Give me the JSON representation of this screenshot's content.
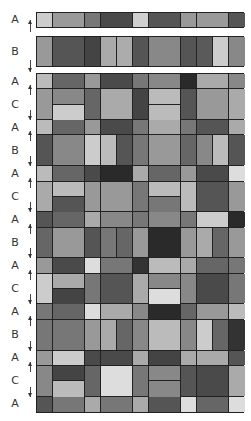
{
  "diagram": {
    "column_edges_px": [
      0,
      16,
      48,
      64,
      96,
      112,
      144,
      160,
      192,
      208
    ],
    "standalone_bands": [
      {
        "label": "A",
        "top": 12,
        "height": 16,
        "cells": [
          {
            "x": 0,
            "w": 16,
            "c": "#cccccc"
          },
          {
            "x": 16,
            "w": 32,
            "c": "#9a9a9a"
          },
          {
            "x": 48,
            "w": 16,
            "c": "#777777"
          },
          {
            "x": 64,
            "w": 32,
            "c": "#4a4a4a"
          },
          {
            "x": 96,
            "w": 16,
            "c": "#cfcfcf"
          },
          {
            "x": 112,
            "w": 32,
            "c": "#555555"
          },
          {
            "x": 144,
            "w": 16,
            "c": "#999999"
          },
          {
            "x": 160,
            "w": 32,
            "c": "#9a9a9a"
          },
          {
            "x": 192,
            "w": 16,
            "c": "#555555"
          }
        ]
      },
      {
        "label": "B",
        "top": 36,
        "height": 31,
        "cells": [
          {
            "x": 0,
            "w": 16,
            "c": "#999999"
          },
          {
            "x": 16,
            "w": 32,
            "c": "#555555"
          },
          {
            "x": 48,
            "w": 16,
            "c": "#444444"
          },
          {
            "x": 64,
            "w": 16,
            "c": "#aaaaaa"
          },
          {
            "x": 80,
            "w": 16,
            "c": "#acacac"
          },
          {
            "x": 96,
            "w": 16,
            "c": "#555555"
          },
          {
            "x": 112,
            "w": 32,
            "c": "#888888"
          },
          {
            "x": 144,
            "w": 16,
            "c": "#555555"
          },
          {
            "x": 160,
            "w": 16,
            "c": "#5a5a5a"
          },
          {
            "x": 176,
            "w": 16,
            "c": "#cccccc"
          },
          {
            "x": 192,
            "w": 16,
            "c": "#888888"
          }
        ]
      }
    ],
    "grid_bands": [
      {
        "label": "A",
        "type": "A",
        "cells": [
          {
            "x": 0,
            "w": 16,
            "c": "#bbbbbb"
          },
          {
            "x": 16,
            "w": 32,
            "c": "#666666"
          },
          {
            "x": 48,
            "w": 16,
            "c": "#999999"
          },
          {
            "x": 64,
            "w": 32,
            "c": "#4a4a4a"
          },
          {
            "x": 96,
            "w": 16,
            "c": "#777777"
          },
          {
            "x": 112,
            "w": 32,
            "c": "#888888"
          },
          {
            "x": 144,
            "w": 16,
            "c": "#2a2a2a"
          },
          {
            "x": 160,
            "w": 32,
            "c": "#aaaaaa"
          },
          {
            "x": 192,
            "w": 16,
            "c": "#888888"
          }
        ]
      },
      {
        "label": "C",
        "type": "C",
        "cells": [
          {
            "x": 0,
            "w": 16,
            "c": "#999999"
          },
          {
            "x": 16,
            "w": 32,
            "c": "#888888",
            "c2": "#cccccc"
          },
          {
            "x": 48,
            "w": 16,
            "c": "#666666"
          },
          {
            "x": 64,
            "w": 32,
            "c": "#aaaaaa"
          },
          {
            "x": 96,
            "w": 16,
            "c": "#444444"
          },
          {
            "x": 112,
            "w": 32,
            "c": "#bbbbbb",
            "c2": "#bbbbbb"
          },
          {
            "x": 144,
            "w": 16,
            "c": "#555555"
          },
          {
            "x": 160,
            "w": 32,
            "c": "#999999"
          },
          {
            "x": 192,
            "w": 16,
            "c": "#aaaaaa"
          }
        ]
      },
      {
        "label": "A",
        "type": "A",
        "cells": [
          {
            "x": 0,
            "w": 16,
            "c": "#bbbbbb"
          },
          {
            "x": 16,
            "w": 32,
            "c": "#666666"
          },
          {
            "x": 48,
            "w": 16,
            "c": "#999999"
          },
          {
            "x": 64,
            "w": 32,
            "c": "#4a4a4a"
          },
          {
            "x": 96,
            "w": 16,
            "c": "#777777"
          },
          {
            "x": 112,
            "w": 32,
            "c": "#aaaaaa"
          },
          {
            "x": 144,
            "w": 16,
            "c": "#777777"
          },
          {
            "x": 160,
            "w": 32,
            "c": "#555555"
          },
          {
            "x": 192,
            "w": 16,
            "c": "#aaaaaa"
          }
        ]
      },
      {
        "label": "B",
        "type": "B",
        "cells": [
          {
            "x": 0,
            "w": 16,
            "c": "#555555"
          },
          {
            "x": 16,
            "w": 32,
            "c": "#888888"
          },
          {
            "x": 48,
            "w": 16,
            "c": "#cccccc"
          },
          {
            "x": 64,
            "w": 16,
            "c": "#bbbbbb"
          },
          {
            "x": 80,
            "w": 16,
            "c": "#555555"
          },
          {
            "x": 96,
            "w": 16,
            "c": "#777777"
          },
          {
            "x": 112,
            "w": 32,
            "c": "#999999"
          },
          {
            "x": 144,
            "w": 16,
            "c": "#666666"
          },
          {
            "x": 160,
            "w": 16,
            "c": "#888888"
          },
          {
            "x": 176,
            "w": 16,
            "c": "#bbbbbb"
          },
          {
            "x": 192,
            "w": 16,
            "c": "#555555"
          }
        ]
      },
      {
        "label": "A",
        "type": "A",
        "cells": [
          {
            "x": 0,
            "w": 16,
            "c": "#bbbbbb"
          },
          {
            "x": 16,
            "w": 32,
            "c": "#666666"
          },
          {
            "x": 48,
            "w": 16,
            "c": "#4a4a4a"
          },
          {
            "x": 64,
            "w": 32,
            "c": "#2a2a2a"
          },
          {
            "x": 96,
            "w": 16,
            "c": "#aaaaaa"
          },
          {
            "x": 112,
            "w": 32,
            "c": "#666666"
          },
          {
            "x": 144,
            "w": 16,
            "c": "#999999"
          },
          {
            "x": 160,
            "w": 32,
            "c": "#4a4a4a"
          },
          {
            "x": 192,
            "w": 16,
            "c": "#dddddd"
          }
        ]
      },
      {
        "label": "C",
        "type": "C",
        "cells": [
          {
            "x": 0,
            "w": 16,
            "c": "#aaaaaa"
          },
          {
            "x": 16,
            "w": 32,
            "c": "#bbbbbb",
            "c2": "#555555"
          },
          {
            "x": 48,
            "w": 16,
            "c": "#999999"
          },
          {
            "x": 64,
            "w": 32,
            "c": "#999999"
          },
          {
            "x": 96,
            "w": 16,
            "c": "#777777"
          },
          {
            "x": 112,
            "w": 32,
            "c": "#bbbbbb",
            "c2": "#777777"
          },
          {
            "x": 144,
            "w": 16,
            "c": "#bbbbbb"
          },
          {
            "x": 160,
            "w": 32,
            "c": "#555555"
          },
          {
            "x": 192,
            "w": 16,
            "c": "#999999"
          }
        ]
      },
      {
        "label": "A",
        "type": "A",
        "cells": [
          {
            "x": 0,
            "w": 16,
            "c": "#555555"
          },
          {
            "x": 16,
            "w": 32,
            "c": "#666666"
          },
          {
            "x": 48,
            "w": 16,
            "c": "#aaaaaa"
          },
          {
            "x": 64,
            "w": 32,
            "c": "#888888"
          },
          {
            "x": 96,
            "w": 16,
            "c": "#777777"
          },
          {
            "x": 112,
            "w": 32,
            "c": "#888888"
          },
          {
            "x": 144,
            "w": 16,
            "c": "#777777"
          },
          {
            "x": 160,
            "w": 32,
            "c": "#cccccc"
          },
          {
            "x": 192,
            "w": 16,
            "c": "#2a2a2a"
          }
        ]
      },
      {
        "label": "B",
        "type": "B",
        "cells": [
          {
            "x": 0,
            "w": 16,
            "c": "#666666"
          },
          {
            "x": 16,
            "w": 32,
            "c": "#999999"
          },
          {
            "x": 48,
            "w": 16,
            "c": "#555555"
          },
          {
            "x": 64,
            "w": 16,
            "c": "#777777"
          },
          {
            "x": 80,
            "w": 16,
            "c": "#666666"
          },
          {
            "x": 96,
            "w": 16,
            "c": "#999999"
          },
          {
            "x": 112,
            "w": 32,
            "c": "#2a2a2a"
          },
          {
            "x": 144,
            "w": 16,
            "c": "#999999"
          },
          {
            "x": 160,
            "w": 16,
            "c": "#aaaaaa"
          },
          {
            "x": 176,
            "w": 16,
            "c": "#666666"
          },
          {
            "x": 192,
            "w": 16,
            "c": "#999999"
          }
        ]
      },
      {
        "label": "A",
        "type": "A",
        "cells": [
          {
            "x": 0,
            "w": 16,
            "c": "#999999"
          },
          {
            "x": 16,
            "w": 32,
            "c": "#4a4a4a"
          },
          {
            "x": 48,
            "w": 16,
            "c": "#dddddd"
          },
          {
            "x": 64,
            "w": 32,
            "c": "#777777"
          },
          {
            "x": 96,
            "w": 16,
            "c": "#333333"
          },
          {
            "x": 112,
            "w": 32,
            "c": "#bbbbbb"
          },
          {
            "x": 144,
            "w": 16,
            "c": "#aaaaaa"
          },
          {
            "x": 160,
            "w": 32,
            "c": "#666666"
          },
          {
            "x": 192,
            "w": 16,
            "c": "#777777"
          }
        ]
      },
      {
        "label": "C",
        "type": "C",
        "cells": [
          {
            "x": 0,
            "w": 16,
            "c": "#cccccc"
          },
          {
            "x": 16,
            "w": 32,
            "c": "#aaaaaa",
            "c2": "#444444"
          },
          {
            "x": 48,
            "w": 16,
            "c": "#777777"
          },
          {
            "x": 64,
            "w": 32,
            "c": "#555555"
          },
          {
            "x": 96,
            "w": 16,
            "c": "#aaaaaa"
          },
          {
            "x": 112,
            "w": 32,
            "c": "#888888",
            "c2": "#dddddd"
          },
          {
            "x": 144,
            "w": 16,
            "c": "#888888"
          },
          {
            "x": 160,
            "w": 32,
            "c": "#4a4a4a"
          },
          {
            "x": 192,
            "w": 16,
            "c": "#777777"
          }
        ]
      },
      {
        "label": "A",
        "type": "A",
        "cells": [
          {
            "x": 0,
            "w": 16,
            "c": "#777777"
          },
          {
            "x": 16,
            "w": 32,
            "c": "#666666"
          },
          {
            "x": 48,
            "w": 16,
            "c": "#dddddd"
          },
          {
            "x": 64,
            "w": 32,
            "c": "#aaaaaa"
          },
          {
            "x": 96,
            "w": 16,
            "c": "#888888"
          },
          {
            "x": 112,
            "w": 32,
            "c": "#2a2a2a"
          },
          {
            "x": 144,
            "w": 16,
            "c": "#666666"
          },
          {
            "x": 160,
            "w": 32,
            "c": "#999999"
          },
          {
            "x": 192,
            "w": 16,
            "c": "#bbbbbb"
          }
        ]
      },
      {
        "label": "B",
        "type": "B",
        "cells": [
          {
            "x": 0,
            "w": 16,
            "c": "#777777"
          },
          {
            "x": 16,
            "w": 32,
            "c": "#777777"
          },
          {
            "x": 48,
            "w": 16,
            "c": "#999999"
          },
          {
            "x": 64,
            "w": 16,
            "c": "#aaaaaa"
          },
          {
            "x": 80,
            "w": 16,
            "c": "#666666"
          },
          {
            "x": 96,
            "w": 16,
            "c": "#888888"
          },
          {
            "x": 112,
            "w": 32,
            "c": "#bbbbbb"
          },
          {
            "x": 144,
            "w": 16,
            "c": "#888888"
          },
          {
            "x": 160,
            "w": 16,
            "c": "#cccccc"
          },
          {
            "x": 176,
            "w": 16,
            "c": "#666666"
          },
          {
            "x": 192,
            "w": 16,
            "c": "#333333"
          }
        ]
      },
      {
        "label": "A",
        "type": "A",
        "cells": [
          {
            "x": 0,
            "w": 16,
            "c": "#999999"
          },
          {
            "x": 16,
            "w": 32,
            "c": "#cccccc"
          },
          {
            "x": 48,
            "w": 16,
            "c": "#4a4a4a"
          },
          {
            "x": 64,
            "w": 32,
            "c": "#4a4a4a"
          },
          {
            "x": 96,
            "w": 16,
            "c": "#aaaaaa"
          },
          {
            "x": 112,
            "w": 32,
            "c": "#444444"
          },
          {
            "x": 144,
            "w": 16,
            "c": "#aaaaaa"
          },
          {
            "x": 160,
            "w": 32,
            "c": "#aaaaaa"
          },
          {
            "x": 192,
            "w": 16,
            "c": "#555555"
          }
        ]
      },
      {
        "label": "C",
        "type": "C",
        "cells": [
          {
            "x": 0,
            "w": 16,
            "c": "#888888"
          },
          {
            "x": 16,
            "w": 32,
            "c": "#444444",
            "c2": "#bbbbbb"
          },
          {
            "x": 48,
            "w": 16,
            "c": "#666666"
          },
          {
            "x": 64,
            "w": 32,
            "c": "#dddddd"
          },
          {
            "x": 96,
            "w": 16,
            "c": "#777777"
          },
          {
            "x": 112,
            "w": 32,
            "c": "#888888",
            "c2": "#888888"
          },
          {
            "x": 144,
            "w": 16,
            "c": "#555555"
          },
          {
            "x": 160,
            "w": 32,
            "c": "#4a4a4a"
          },
          {
            "x": 192,
            "w": 16,
            "c": "#aaaaaa"
          }
        ]
      },
      {
        "label": "A",
        "type": "A",
        "cells": [
          {
            "x": 0,
            "w": 16,
            "c": "#555555"
          },
          {
            "x": 16,
            "w": 32,
            "c": "#777777"
          },
          {
            "x": 48,
            "w": 16,
            "c": "#aaaaaa"
          },
          {
            "x": 64,
            "w": 32,
            "c": "#777777"
          },
          {
            "x": 96,
            "w": 16,
            "c": "#aaaaaa"
          },
          {
            "x": 112,
            "w": 32,
            "c": "#555555"
          },
          {
            "x": 144,
            "w": 16,
            "c": "#dddddd"
          },
          {
            "x": 160,
            "w": 32,
            "c": "#666666"
          },
          {
            "x": 192,
            "w": 16,
            "c": "#dddddd"
          }
        ]
      }
    ]
  }
}
